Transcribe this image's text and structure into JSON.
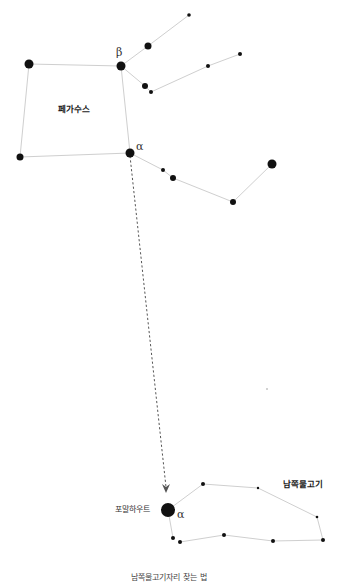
{
  "diagram": {
    "caption": "남쪽물고기자리 찾는 법",
    "colors": {
      "star": "#111111",
      "line": "#cfcfcf",
      "arrow": "#555555",
      "text": "#222222"
    },
    "constellations": [
      {
        "name": "페가수스",
        "label": "페가수스",
        "label_pos": [
          58,
          104
        ],
        "stars": [
          {
            "id": "beta",
            "x": 121,
            "y": 66,
            "r": 4.5,
            "greek": "β"
          },
          {
            "id": "alpha",
            "x": 130,
            "y": 153,
            "r": 4.5,
            "greek": "α"
          },
          {
            "id": "tl",
            "x": 29,
            "y": 64,
            "r": 4.5
          },
          {
            "id": "bl",
            "x": 20,
            "y": 157,
            "r": 3.5
          },
          {
            "id": "u1",
            "x": 148,
            "y": 46,
            "r": 3.5
          },
          {
            "id": "u2",
            "x": 189,
            "y": 15,
            "r": 1.8
          },
          {
            "id": "m1",
            "x": 145,
            "y": 86,
            "r": 3
          },
          {
            "id": "m2",
            "x": 151,
            "y": 92,
            "r": 2
          },
          {
            "id": "m3",
            "x": 208,
            "y": 66,
            "r": 2
          },
          {
            "id": "m4",
            "x": 240,
            "y": 54,
            "r": 2
          },
          {
            "id": "l1",
            "x": 163,
            "y": 170,
            "r": 2
          },
          {
            "id": "l2",
            "x": 173,
            "y": 178,
            "r": 3
          },
          {
            "id": "l3",
            "x": 233,
            "y": 202,
            "r": 3
          },
          {
            "id": "l4",
            "x": 272,
            "y": 164,
            "r": 4.5
          }
        ],
        "lines": [
          [
            "tl",
            "beta"
          ],
          [
            "beta",
            "alpha"
          ],
          [
            "alpha",
            "bl"
          ],
          [
            "bl",
            "tl"
          ],
          [
            "beta",
            "u1"
          ],
          [
            "u1",
            "u2"
          ],
          [
            "beta",
            "m1"
          ],
          [
            "m1",
            "m2"
          ],
          [
            "m2",
            "m3"
          ],
          [
            "m3",
            "m4"
          ],
          [
            "alpha",
            "l1"
          ],
          [
            "l1",
            "l2"
          ],
          [
            "l2",
            "l3"
          ],
          [
            "l3",
            "l4"
          ]
        ]
      },
      {
        "name": "남쪽물고기",
        "label": "남쪽물고기",
        "label_pos": [
          283,
          479
        ],
        "stars": [
          {
            "id": "fomalhaut",
            "x": 168,
            "y": 510,
            "r": 7,
            "greek": "α",
            "name": "포말하우트"
          },
          {
            "id": "p1",
            "x": 203,
            "y": 484,
            "r": 2
          },
          {
            "id": "p2",
            "x": 258,
            "y": 488,
            "r": 1.2
          },
          {
            "id": "p3",
            "x": 317,
            "y": 517,
            "r": 1.3
          },
          {
            "id": "p4",
            "x": 323,
            "y": 540,
            "r": 2
          },
          {
            "id": "p5",
            "x": 273,
            "y": 541,
            "r": 2
          },
          {
            "id": "p6",
            "x": 224,
            "y": 535,
            "r": 2
          },
          {
            "id": "p7",
            "x": 180,
            "y": 542,
            "r": 2
          },
          {
            "id": "p8",
            "x": 173,
            "y": 538,
            "r": 2
          }
        ],
        "lines": [
          [
            "fomalhaut",
            "p1"
          ],
          [
            "p1",
            "p2"
          ],
          [
            "p2",
            "p3"
          ],
          [
            "p3",
            "p4"
          ],
          [
            "p4",
            "p5"
          ],
          [
            "p5",
            "p6"
          ],
          [
            "p6",
            "p7"
          ],
          [
            "p8",
            "fomalhaut"
          ]
        ]
      }
    ],
    "stray_stars": [
      {
        "x": 267,
        "y": 389,
        "r": 0.8
      }
    ],
    "pointer": {
      "from": [
        130,
        156
      ],
      "to": [
        166,
        493
      ],
      "style": "dashed-arrow"
    },
    "labels": {
      "pegasus": "페가수스",
      "piscis_austrinus": "남쪽물고기",
      "fomalhaut": "포말하우트",
      "beta": "β",
      "alpha_pegasus": "α",
      "alpha_fomalhaut": "α"
    }
  }
}
